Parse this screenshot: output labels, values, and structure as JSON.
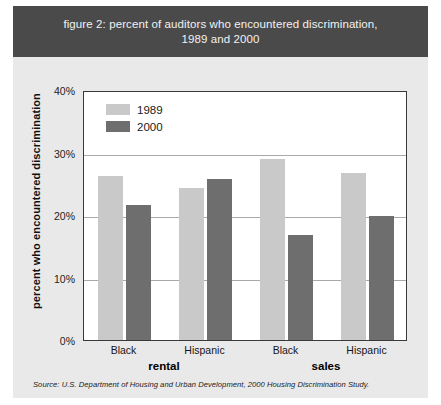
{
  "figure": {
    "title": "figure 2: percent of auditors who encountered discrimination, 1989 and 2000",
    "title_line1": "figure 2: percent of auditors who encountered discrimination,",
    "title_line2": "1989 and 2000",
    "source": "Source: U.S. Department of Housing and Urban Development, 2000 Housing Discrimination Study.",
    "colors": {
      "title_band": "#4a4a4a",
      "figure_background": "#e9e9e9",
      "plot_background": "#ffffff",
      "series_1989": "#c9c9c9",
      "series_2000": "#6e6e6e",
      "gridline": "#a9a9a9",
      "axis_border": "#3a3a3a"
    }
  },
  "chart_data": {
    "type": "bar",
    "title": "figure 2: percent of auditors who encountered discrimination, 1989 and 2000",
    "xlabel": "",
    "ylabel": "percent who encountered discrimination",
    "ylim": [
      0,
      40
    ],
    "ytick_labels": [
      "0%",
      "10%",
      "20%",
      "30%",
      "40%"
    ],
    "ytick_values": [
      0,
      10,
      20,
      30,
      40
    ],
    "grid": true,
    "legend_position": "top-left inside plot",
    "categories": [
      "Black",
      "Hispanic",
      "Black",
      "Hispanic"
    ],
    "groups": [
      {
        "name": "rental",
        "categories": [
          "Black",
          "Hispanic"
        ]
      },
      {
        "name": "sales",
        "categories": [
          "Black",
          "Hispanic"
        ]
      }
    ],
    "series": [
      {
        "name": "1989",
        "color": "#c9c9c9",
        "values": [
          26.3,
          24.3,
          28.9,
          26.8
        ]
      },
      {
        "name": "2000",
        "color": "#6e6e6e",
        "values": [
          21.6,
          25.8,
          16.8,
          19.8
        ]
      }
    ]
  },
  "axis": {
    "y_title": "percent who encountered discrimination"
  },
  "legend": {
    "items": [
      {
        "label": "1989",
        "series": "s1989"
      },
      {
        "label": "2000",
        "series": "s2000"
      }
    ]
  }
}
